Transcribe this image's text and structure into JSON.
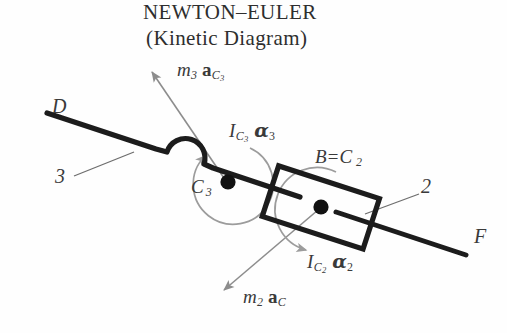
{
  "title": {
    "line1": "NEWTON–EULER",
    "line2": "(Kinetic Diagram)"
  },
  "colors": {
    "link_stroke": "#1c1c1c",
    "vector_arrow": "#8a8a8a",
    "moment_arrow": "#9a9a9a",
    "leader_line": "#6e6e6e",
    "text": "#3a3a3a",
    "background": "#fefefe"
  },
  "labels": {
    "point_d": "D",
    "point_f": "F",
    "link_3": "3",
    "link_2": "2",
    "center_c3": "C",
    "center_c3_sub": "3",
    "block_label": "B=C",
    "block_label_sub": "2"
  },
  "vectors": [
    {
      "id": "m3-aC3",
      "symbol_mass": "m",
      "mass_sub": "3",
      "symbol_accel": "a",
      "accel_sub": "C",
      "accel_sub2": "3",
      "direction": "up-left",
      "from": "C3",
      "color": "#8a8a8a"
    },
    {
      "id": "m2-aC",
      "symbol_mass": "m",
      "mass_sub": "2",
      "symbol_accel": "a",
      "accel_sub": "C",
      "accel_sub2": "",
      "direction": "down-left",
      "from": "C2",
      "color": "#8a8a8a"
    }
  ],
  "moments": [
    {
      "id": "IC3-alpha3",
      "symbol_inertia": "I",
      "inertia_sub": "C",
      "inertia_sub2": "3",
      "symbol_alpha": "α",
      "alpha_sub": "3",
      "about": "C3",
      "sense": "counterclockwise",
      "color": "#9a9a9a"
    },
    {
      "id": "IC2-alpha2",
      "symbol_inertia": "I",
      "inertia_sub": "C",
      "inertia_sub2": "2",
      "symbol_alpha": "α",
      "alpha_sub": "2",
      "about": "C2",
      "sense": "clockwise",
      "color": "#9a9a9a"
    }
  ],
  "geometry": {
    "line_left_end": [
      47,
      113
    ],
    "line_right_end": [
      466,
      255
    ],
    "c3_point": [
      228,
      182
    ],
    "c2_point": [
      321,
      207
    ],
    "block_center": [
      321,
      207
    ],
    "block_angle_deg": 18
  }
}
